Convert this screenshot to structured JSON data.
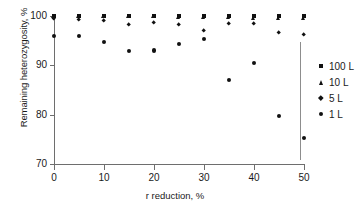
{
  "chart_data": {
    "type": "scatter",
    "title": "",
    "xlabel": "r reduction, %",
    "ylabel": "Remaining heterozygosity, %",
    "xlim": [
      0,
      50
    ],
    "ylim": [
      70,
      100
    ],
    "xticks": [
      0,
      10,
      20,
      30,
      40,
      50
    ],
    "yticks": [
      70,
      80,
      90,
      100
    ],
    "grid": false,
    "legend_position": "right",
    "x": [
      0,
      5,
      10,
      15,
      20,
      25,
      30,
      35,
      40,
      45,
      50
    ],
    "series": [
      {
        "name": "100 L",
        "marker": "square",
        "color": "#111111",
        "values": [
          100.0,
          100.0,
          100.0,
          100.0,
          100.0,
          100.0,
          100.0,
          100.0,
          100.0,
          100.0,
          100.0
        ]
      },
      {
        "name": "10 L",
        "marker": "triangle",
        "color": "#111111",
        "values": [
          99.9,
          99.9,
          99.8,
          99.8,
          99.8,
          99.7,
          99.6,
          99.6,
          99.5,
          99.5,
          99.4
        ]
      },
      {
        "name": "5 L",
        "marker": "diamond",
        "color": "#111111",
        "values": [
          99.4,
          99.2,
          99.1,
          98.3,
          98.6,
          98.2,
          97.0,
          98.5,
          98.4,
          96.6,
          96.3
        ]
      },
      {
        "name": "1 L",
        "marker": "circle",
        "color": "#111111",
        "values": [
          95.9,
          95.9,
          94.7,
          92.9,
          93.0,
          94.4,
          95.3,
          87.0,
          90.5,
          79.8,
          75.3
        ]
      }
    ]
  },
  "legend": {
    "items": [
      {
        "label": "100 L",
        "marker": "square"
      },
      {
        "label": "10 L",
        "marker": "triangle"
      },
      {
        "label": "5 L",
        "marker": "diamond"
      },
      {
        "label": "1 L",
        "marker": "circle"
      }
    ]
  },
  "axes": {
    "x_tick_labels": [
      "0",
      "10",
      "20",
      "30",
      "40",
      "50"
    ],
    "y_tick_labels": [
      "70",
      "80",
      "90",
      "100"
    ]
  }
}
